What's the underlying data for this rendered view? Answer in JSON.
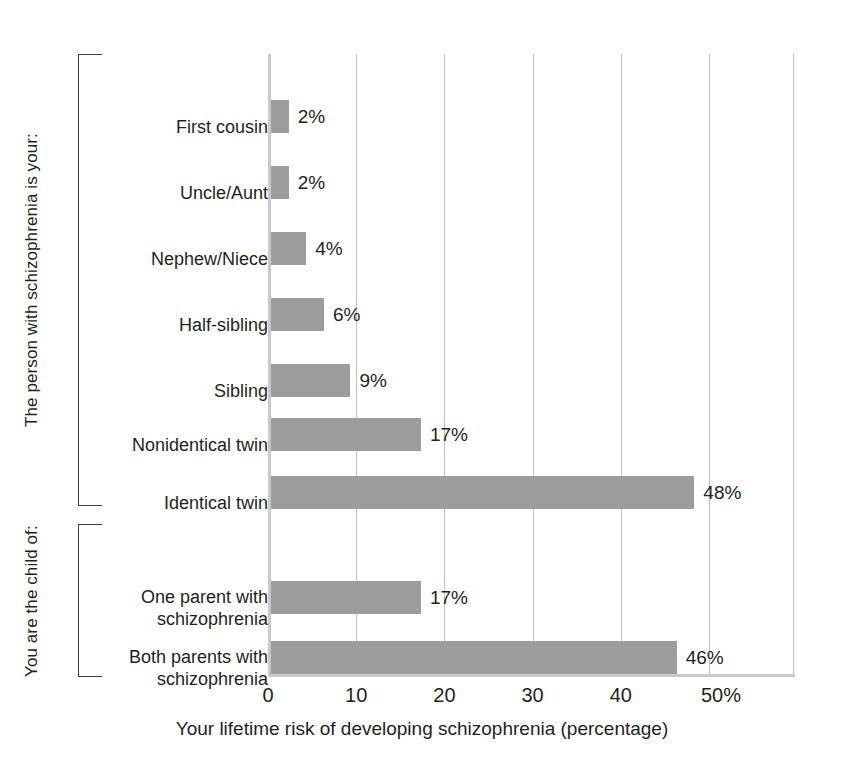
{
  "chart_data": {
    "type": "bar",
    "orientation": "horizontal",
    "title": "",
    "xlabel": "Your lifetime risk of developing schizophrenia (percentage)",
    "ylabel": "",
    "xlim": [
      0,
      59.9
    ],
    "ylim": null,
    "grid": "vertical",
    "legend": "none",
    "bar_color": "#9d9d9d",
    "xticks": [
      0,
      10,
      20,
      30,
      40,
      50
    ],
    "xtick_labels": [
      "0",
      "10",
      "20",
      "30",
      "40",
      "50%"
    ],
    "categories": [
      "First cousin",
      "Uncle/Aunt",
      "Nephew/Niece",
      "Half-sibling",
      "Sibling",
      "Nonidentical twin",
      "Identical twin",
      "One parent with\nschizophrenia",
      "Both parents with\nschizophrenia"
    ],
    "values": [
      2,
      2,
      4,
      6,
      9,
      17,
      48,
      17,
      46
    ],
    "value_labels": [
      "2%",
      "2%",
      "4%",
      "6%",
      "9%",
      "17%",
      "48%",
      "17%",
      "46%"
    ],
    "groups": [
      {
        "label": "The person with schizophrenia is your:",
        "categories": [
          0,
          1,
          2,
          3,
          4,
          5,
          6
        ]
      },
      {
        "label": "You are the child of:",
        "categories": [
          7,
          8
        ]
      }
    ]
  }
}
